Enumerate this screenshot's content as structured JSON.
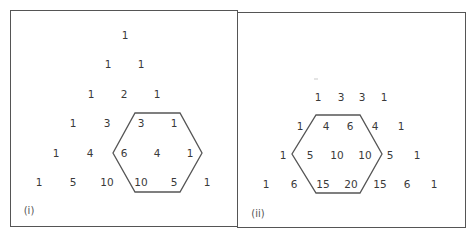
{
  "panels": [
    {
      "label": "(i)",
      "rows": [
        [
          "1"
        ],
        [
          "1",
          "1"
        ],
        [
          "1",
          "2",
          "1"
        ],
        [
          "1",
          "3",
          "3",
          "1"
        ],
        [
          "1",
          "4",
          "6",
          "4",
          "1"
        ],
        [
          "1",
          "5",
          "10",
          "10",
          "5",
          "1"
        ]
      ],
      "hexagon_enclosed": [
        "3",
        "1",
        "6",
        "4",
        "1",
        "10",
        "5"
      ]
    },
    {
      "label": "(ii)",
      "rows": [
        [
          "1",
          "3",
          "3",
          "1"
        ],
        [
          "1",
          "4",
          "6",
          "4",
          "1"
        ],
        [
          "1",
          "5",
          "10",
          "10",
          "5",
          "1"
        ],
        [
          "1",
          "6",
          "15",
          "20",
          "15",
          "6",
          "1"
        ]
      ],
      "hexagon_enclosed": [
        "4",
        "6",
        "5",
        "10",
        "10",
        "15",
        "20"
      ]
    }
  ],
  "colors": {
    "line": "#555555",
    "text": "#3a3a3a",
    "background": "#ffffff"
  }
}
